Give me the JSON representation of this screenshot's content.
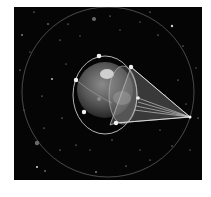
{
  "scene": {
    "description": "Earth with satellite orbits and coverage beam cone in starfield",
    "background": "#050505",
    "earth": {
      "cx": 105,
      "cy": 90,
      "r": 28,
      "color": "#6a6a6a"
    },
    "inner_orbit": {
      "cx": 105,
      "cy": 95,
      "rx": 32,
      "ry": 39
    },
    "outer_orbit": {
      "cx": 108,
      "cy": 92,
      "rx": 86,
      "ry": 85
    },
    "beam_apex": {
      "x": 190,
      "y": 117
    },
    "satellites": [
      {
        "x": 99,
        "y": 56
      },
      {
        "x": 76,
        "y": 80
      },
      {
        "x": 84,
        "y": 112
      },
      {
        "x": 131,
        "y": 67
      },
      {
        "x": 138,
        "y": 98
      },
      {
        "x": 116,
        "y": 123
      }
    ]
  }
}
